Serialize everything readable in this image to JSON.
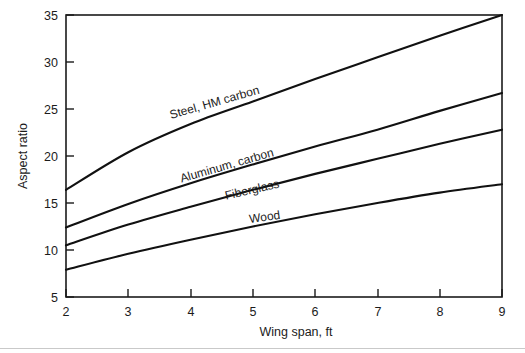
{
  "chart_data": {
    "type": "line",
    "title": "",
    "xlabel": "Wing span, ft",
    "ylabel": "Aspect ratio",
    "xlim": [
      2,
      9
    ],
    "ylim": [
      5,
      35
    ],
    "xticks": [
      2,
      3,
      4,
      5,
      6,
      7,
      8,
      9
    ],
    "xtick_labels": [
      "2",
      "3",
      "4",
      "5",
      "6",
      "7",
      "8",
      "9"
    ],
    "yticks": [
      5,
      10,
      15,
      20,
      25,
      30,
      35
    ],
    "ytick_labels": [
      "5",
      "10",
      "15",
      "20",
      "25",
      "30",
      "35"
    ],
    "grid": false,
    "legend": "inline-curve-labels",
    "x": [
      2,
      3,
      4,
      5,
      6,
      7,
      8,
      9
    ],
    "series": [
      {
        "name": "Steel, HM carbon",
        "label": "Steel, HM carbon",
        "color": "#111111",
        "values": [
          16.4,
          20.4,
          23.4,
          25.8,
          28.2,
          30.5,
          32.8,
          35.0
        ]
      },
      {
        "name": "Aluminum, carbon",
        "label": "Aluminum, carbon",
        "color": "#111111",
        "values": [
          12.4,
          14.9,
          17.1,
          19.1,
          21.0,
          22.8,
          24.8,
          26.7
        ]
      },
      {
        "name": "Fiberglass",
        "label": "Fiberglass",
        "color": "#111111",
        "values": [
          10.5,
          12.7,
          14.6,
          16.4,
          18.1,
          19.7,
          21.3,
          22.8
        ]
      },
      {
        "name": "Wood",
        "label": "Wood",
        "color": "#111111",
        "values": [
          7.9,
          9.6,
          11.1,
          12.5,
          13.8,
          15.0,
          16.1,
          17.0
        ]
      }
    ],
    "annotations": [
      {
        "text": "Steel, HM carbon",
        "x": 4.4,
        "y": 25.3,
        "rotation": -16
      },
      {
        "text": "Aluminum, carbon",
        "x": 4.6,
        "y": 18.6,
        "rotation": -16
      },
      {
        "text": "Fiberglass",
        "x": 5.0,
        "y": 16.0,
        "rotation": -13
      },
      {
        "text": "Wood",
        "x": 5.2,
        "y": 13.1,
        "rotation": -8
      }
    ]
  },
  "colors": {
    "background": "#ffffff",
    "axis": "#1b1b1b",
    "curve": "#111111",
    "footer_rule": "#c9c9c9"
  }
}
